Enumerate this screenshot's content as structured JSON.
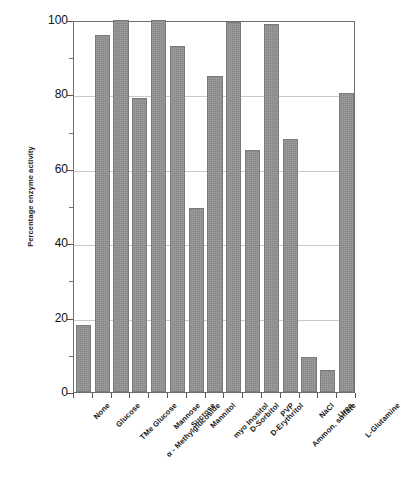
{
  "chart_data": {
    "type": "bar",
    "title": "",
    "subtitle": "",
    "xlabel": "",
    "ylabel": "Percentage enzyme activity",
    "ylim": [
      0,
      100
    ],
    "yticks": [
      0,
      20,
      40,
      60,
      80,
      100
    ],
    "ytick_labels": [
      "0",
      "20",
      "40",
      "60",
      "80",
      "100"
    ],
    "yminor_ticks": [
      10,
      30,
      50,
      70,
      90
    ],
    "grid": "horizontal-major",
    "legend": "none",
    "orientation": "vertical",
    "bar_color": "#878787",
    "bar_edge_color": "#7a7a7a",
    "frame_color": "#6f6f6f",
    "gridline_color": "#c9c9c9",
    "background_color": "#ffffff",
    "categories": [
      "None",
      "Glucose",
      "TMe Glucose",
      "α - Methylglucoside",
      "Mannose",
      "Sucrose",
      "Mannitol",
      "myo Inositol",
      "D-Sorbitol",
      "D-Erythritol",
      "PVP",
      "Ammon. sulfate",
      "NaCl",
      "Urea",
      "L-Glutamine"
    ],
    "values": [
      18,
      96,
      100,
      79,
      100,
      93,
      49.5,
      85,
      99.5,
      65,
      99,
      68,
      9.5,
      6,
      80.5
    ]
  },
  "axis": {
    "y_title": "Percentage enzyme activity"
  }
}
